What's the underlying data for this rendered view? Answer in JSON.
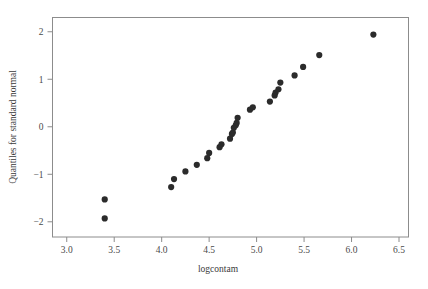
{
  "chart_data": {
    "type": "scatter",
    "title": "",
    "subtitle": "",
    "xlabel": "logcontam",
    "ylabel": "Quantiles for standard normal",
    "xlim": [
      2.85,
      6.6
    ],
    "ylim": [
      -2.32,
      2.3
    ],
    "xticks": [
      3.0,
      3.5,
      4.0,
      4.5,
      5.0,
      5.5,
      6.0,
      6.5
    ],
    "xticklabels": [
      "3.0",
      "3.5",
      "4.0",
      "4.5",
      "5.0",
      "5.5",
      "6.0",
      "6.5"
    ],
    "yticks": [
      -2,
      -1,
      0,
      1,
      2
    ],
    "yticklabels": [
      "−2",
      "−1",
      "0",
      "1",
      "2"
    ],
    "grid": false,
    "legend": null,
    "marker": "filled-circle",
    "marker_color": "#2b2b2b",
    "marker_size": 3.1,
    "n_points": 27,
    "x": [
      3.4,
      3.4,
      4.1,
      4.13,
      4.25,
      4.37,
      4.48,
      4.5,
      4.61,
      4.63,
      4.72,
      4.74,
      4.75,
      4.76,
      4.78,
      4.79,
      4.8,
      4.93,
      4.96,
      5.14,
      5.19,
      5.2,
      5.23,
      5.25,
      5.4,
      5.49,
      5.66,
      6.23
    ],
    "y": [
      -1.53,
      -1.93,
      -1.27,
      -1.1,
      -0.94,
      -0.8,
      -0.66,
      -0.55,
      -0.43,
      -0.37,
      -0.25,
      -0.15,
      -0.12,
      -0.02,
      0.03,
      0.08,
      0.19,
      0.36,
      0.41,
      0.53,
      0.66,
      0.72,
      0.79,
      0.93,
      1.08,
      1.26,
      1.51,
      1.94
    ],
    "points": [
      {
        "x": 3.4,
        "y": -1.53
      },
      {
        "x": 3.4,
        "y": -1.93
      },
      {
        "x": 4.1,
        "y": -1.27
      },
      {
        "x": 4.13,
        "y": -1.1
      },
      {
        "x": 4.25,
        "y": -0.94
      },
      {
        "x": 4.37,
        "y": -0.8
      },
      {
        "x": 4.48,
        "y": -0.66
      },
      {
        "x": 4.5,
        "y": -0.55
      },
      {
        "x": 4.61,
        "y": -0.43
      },
      {
        "x": 4.63,
        "y": -0.37
      },
      {
        "x": 4.72,
        "y": -0.25
      },
      {
        "x": 4.74,
        "y": -0.15
      },
      {
        "x": 4.75,
        "y": -0.12
      },
      {
        "x": 4.76,
        "y": -0.02
      },
      {
        "x": 4.78,
        "y": 0.03
      },
      {
        "x": 4.79,
        "y": 0.08
      },
      {
        "x": 4.8,
        "y": 0.19
      },
      {
        "x": 4.93,
        "y": 0.36
      },
      {
        "x": 4.96,
        "y": 0.41
      },
      {
        "x": 5.14,
        "y": 0.53
      },
      {
        "x": 5.19,
        "y": 0.66
      },
      {
        "x": 5.2,
        "y": 0.72
      },
      {
        "x": 5.23,
        "y": 0.79
      },
      {
        "x": 5.25,
        "y": 0.93
      },
      {
        "x": 5.4,
        "y": 1.08
      },
      {
        "x": 5.49,
        "y": 1.26
      },
      {
        "x": 5.66,
        "y": 1.51
      },
      {
        "x": 6.23,
        "y": 1.94
      }
    ]
  },
  "figure": {
    "background_color": "#ffffff",
    "frame_color": "#8c8c8c",
    "text_color": "#3a3a3a"
  }
}
